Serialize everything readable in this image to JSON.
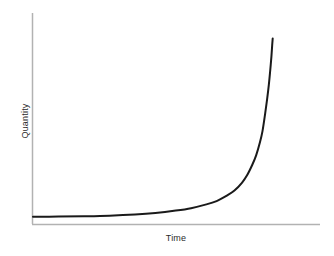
{
  "chart_data": {
    "type": "line",
    "title": "",
    "subtitle": "",
    "xlabel": "Time",
    "ylabel": "Quantity",
    "xlim": [
      0,
      1
    ],
    "ylim": [
      0,
      1
    ],
    "grid": false,
    "legend": null,
    "xticks": [],
    "yticks": [],
    "xticklabels": [],
    "yticklabels": [],
    "annotations": [],
    "series": [
      {
        "name": "exponential growth",
        "color": "#1a1a1a",
        "linewidth": 2,
        "x": [
          0.0,
          0.1,
          0.2,
          0.3,
          0.4,
          0.48,
          0.56,
          0.62,
          0.68,
          0.72,
          0.76,
          0.79,
          0.82,
          0.84,
          0.86,
          0.875,
          0.89,
          0.9,
          0.91,
          0.918,
          0.925,
          0.93,
          0.935,
          0.938,
          0.94
        ],
        "y": [
          0.012,
          0.013,
          0.015,
          0.018,
          0.024,
          0.032,
          0.045,
          0.058,
          0.078,
          0.096,
          0.125,
          0.152,
          0.195,
          0.235,
          0.29,
          0.34,
          0.41,
          0.47,
          0.56,
          0.64,
          0.72,
          0.79,
          0.87,
          0.93,
          0.965
        ]
      }
    ]
  },
  "axes": {
    "y_axis_color": "#b2b2b2",
    "x_axis_color": "#b2b2b2",
    "axis_linewidth": 1.5,
    "background_color": "#ffffff"
  }
}
